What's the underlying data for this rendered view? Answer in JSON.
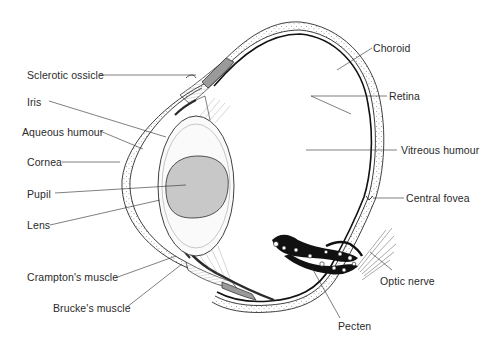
{
  "diagram": {
    "colors": {
      "line": "#2a2a2a",
      "lens_core_fill": "#c8c8c8",
      "background": "#ffffff",
      "muscle_fill": "#9a9a9a",
      "pecten_fill": "#111111"
    },
    "labels_left": [
      {
        "id": "sclerotic-ossicle",
        "text": "Sclerotic ossicle"
      },
      {
        "id": "iris",
        "text": "Iris"
      },
      {
        "id": "aqueous-humour",
        "text": "Aqueous humour"
      },
      {
        "id": "cornea",
        "text": "Cornea"
      },
      {
        "id": "pupil",
        "text": "Pupil"
      },
      {
        "id": "lens",
        "text": "Lens"
      },
      {
        "id": "cramptons-muscle",
        "text": "Crampton's muscle"
      },
      {
        "id": "bruckes-muscle",
        "text": "Brucke's muscle"
      }
    ],
    "labels_right": [
      {
        "id": "choroid",
        "text": "Choroid"
      },
      {
        "id": "retina",
        "text": "Retina"
      },
      {
        "id": "vitreous-humour",
        "text": "Vitreous humour"
      },
      {
        "id": "central-fovea",
        "text": "Central fovea"
      },
      {
        "id": "optic-nerve",
        "text": "Optic nerve"
      },
      {
        "id": "pecten",
        "text": "Pecten"
      }
    ]
  }
}
